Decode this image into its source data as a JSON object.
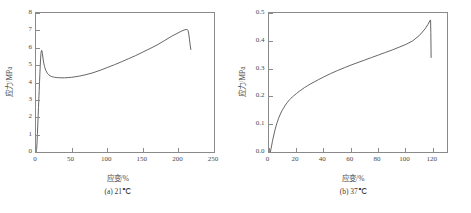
{
  "figure": {
    "panels": [
      {
        "id": "panel-a",
        "caption": "(a) 21℃",
        "xlabel": "应变/%",
        "ylabel": "应力/MPa",
        "xticks": [
          "0",
          "50",
          "100",
          "150",
          "200",
          "250"
        ],
        "yticks": [
          "0",
          "1",
          "2",
          "3",
          "4",
          "5",
          "6",
          "7",
          "8"
        ]
      },
      {
        "id": "panel-b",
        "caption": "(b) 37℃",
        "xlabel": "应变/%",
        "ylabel": "应力/MPa",
        "xticks": [
          "0",
          "20",
          "40",
          "60",
          "80",
          "100",
          "120"
        ],
        "yticks": [
          "0.0",
          "0.1",
          "0.2",
          "0.3",
          "0.4",
          "0.5"
        ]
      }
    ]
  },
  "chart_data": [
    {
      "type": "line",
      "title": "(a) 21℃",
      "xlabel": "应变/%",
      "ylabel": "应力/MPa",
      "xlim": [
        0,
        250
      ],
      "ylim": [
        0,
        8
      ],
      "xticks": [
        0,
        50,
        100,
        150,
        200,
        250
      ],
      "yticks": [
        0,
        1,
        2,
        3,
        4,
        5,
        6,
        7,
        8
      ],
      "grid": false,
      "legend": null,
      "series": [
        {
          "name": "stress-strain 21C",
          "color": "#555555",
          "x": [
            1.0,
            1.5,
            2.0,
            2.5,
            3.0,
            3.5,
            4.0,
            4.5,
            5.0,
            5.5,
            6.0,
            6.5,
            7.0,
            7.5,
            8.0,
            8.5,
            9.0,
            10.0,
            11.0,
            12.0,
            13.0,
            14.0,
            15.0,
            16.5,
            18.0,
            20.0,
            22.0,
            24.0,
            26.0,
            30.0,
            35.0,
            40.0,
            45.0,
            50.0,
            60.0,
            70.0,
            80.0,
            90.0,
            100.0,
            110.0,
            120.0,
            130.0,
            140.0,
            150.0,
            160.0,
            170.0,
            180.0,
            190.0,
            198.0,
            204.0,
            208.0,
            211.0,
            212.5,
            213.5,
            214.5,
            215.5,
            216.5,
            217.5
          ],
          "y": [
            0.2,
            0.55,
            1.05,
            1.55,
            2.05,
            2.55,
            3.05,
            3.55,
            4.05,
            4.55,
            5.0,
            5.4,
            5.68,
            5.82,
            5.85,
            5.8,
            5.66,
            5.35,
            5.1,
            4.92,
            4.78,
            4.68,
            4.6,
            4.5,
            4.44,
            4.38,
            4.34,
            4.32,
            4.3,
            4.28,
            4.27,
            4.27,
            4.28,
            4.3,
            4.36,
            4.45,
            4.56,
            4.7,
            4.86,
            5.02,
            5.19,
            5.37,
            5.55,
            5.75,
            5.95,
            6.16,
            6.4,
            6.65,
            6.82,
            6.95,
            7.02,
            7.05,
            7.05,
            7.0,
            6.8,
            6.5,
            6.15,
            5.9
          ]
        }
      ],
      "annotations": {
        "yield_peak": {
          "x": 8,
          "y": 5.85
        },
        "plateau": {
          "x": 40,
          "y": 4.27
        },
        "break_point": {
          "x": 212.5,
          "y": 7.05
        },
        "final_point": {
          "x": 217.5,
          "y": 5.9
        }
      }
    },
    {
      "type": "line",
      "title": "(b) 37℃",
      "xlabel": "应变/%",
      "ylabel": "应力/MPa",
      "xlim": [
        0,
        130
      ],
      "ylim": [
        0.0,
        0.5
      ],
      "xticks": [
        0,
        20,
        40,
        60,
        80,
        100,
        120
      ],
      "yticks": [
        0.0,
        0.1,
        0.2,
        0.3,
        0.4,
        0.5
      ],
      "grid": false,
      "legend": null,
      "series": [
        {
          "name": "stress-strain 37C",
          "color": "#8a8a8a",
          "x": [
            1.0,
            1.5,
            2.0,
            2.5,
            3.0,
            4.0,
            5.0,
            6.0,
            7.0,
            8.0,
            9.0,
            10.0,
            11.0,
            12.0,
            13.0,
            14.0,
            15.0,
            16.0,
            17.0,
            18.0,
            19.0,
            20.0,
            22.0,
            24.0,
            26.0,
            28.0,
            30.0,
            33.0,
            36.0,
            40.0,
            45.0,
            50.0,
            55.0,
            60.0,
            65.0,
            70.0,
            75.0,
            80.0,
            85.0,
            90.0,
            95.0,
            100.0,
            105.0,
            110.0,
            114.0,
            116.0,
            117.5,
            118.0,
            118.2,
            118.4
          ],
          "y": [
            0.0,
            0.012,
            0.025,
            0.038,
            0.05,
            0.072,
            0.091,
            0.107,
            0.121,
            0.133,
            0.144,
            0.153,
            0.161,
            0.169,
            0.176,
            0.182,
            0.188,
            0.193,
            0.198,
            0.202,
            0.206,
            0.21,
            0.218,
            0.225,
            0.232,
            0.238,
            0.244,
            0.252,
            0.26,
            0.27,
            0.282,
            0.293,
            0.303,
            0.313,
            0.322,
            0.331,
            0.34,
            0.349,
            0.358,
            0.367,
            0.377,
            0.387,
            0.4,
            0.42,
            0.443,
            0.458,
            0.472,
            0.475,
            0.43,
            0.34
          ]
        }
      ],
      "annotations": {
        "break_point": {
          "x": 118.0,
          "y": 0.475
        },
        "final_point": {
          "x": 118.4,
          "y": 0.34
        }
      }
    }
  ]
}
